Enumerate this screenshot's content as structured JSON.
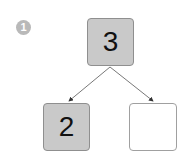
{
  "badge": {
    "number": "1"
  },
  "tree": {
    "root": {
      "value": "3",
      "filled": true
    },
    "children": [
      {
        "value": "2",
        "filled": true
      },
      {
        "value": "",
        "filled": false
      }
    ]
  },
  "colors": {
    "filled": "#c9c9c9",
    "border": "#8f8f8f",
    "badge": "#b9b9b9",
    "edge": "#555555"
  }
}
